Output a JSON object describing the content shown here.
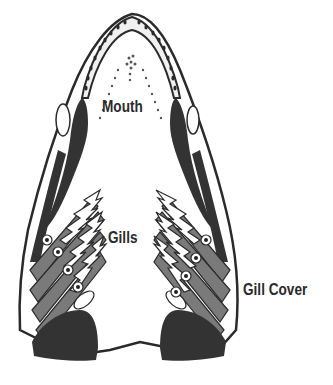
{
  "diagram": {
    "labels": {
      "mouth": "Mouth",
      "gills": "Gills",
      "gill_cover": "Gill Cover"
    },
    "colors": {
      "ink": "#2a2a2a",
      "dark_fill": "#333333",
      "mid_fill": "#7a7a7a",
      "background": "#ffffff"
    }
  }
}
